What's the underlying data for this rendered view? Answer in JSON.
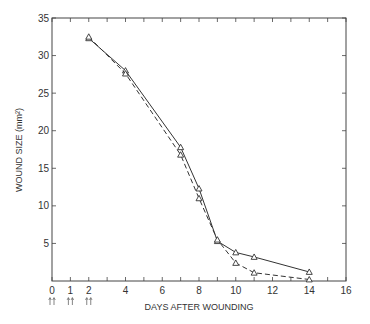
{
  "chart_data": {
    "type": "line",
    "title": "",
    "xlabel": "DAYS AFTER WOUNDING",
    "ylabel": "WOUND SIZE (mm²)",
    "xlim": [
      0,
      16
    ],
    "ylim": [
      0,
      35
    ],
    "x_ticks": [
      "0",
      "1",
      "2",
      "4",
      "6",
      "8",
      "10",
      "12",
      "14",
      "16"
    ],
    "y_ticks": [
      "5",
      "10",
      "15",
      "20",
      "25",
      "30",
      "35"
    ],
    "annotations": [
      "↑↑ at day 0",
      "↑↑ at day 1",
      "↑↑ at day 2"
    ],
    "grid": false,
    "legend": null,
    "series": [
      {
        "name": "solid line (triangles)",
        "style": "solid",
        "x": [
          2,
          4,
          7,
          8,
          9,
          10,
          11,
          14
        ],
        "values": [
          32.3,
          28.0,
          17.8,
          12.3,
          5.3,
          3.8,
          3.2,
          1.2
        ]
      },
      {
        "name": "dashed line (triangles)",
        "style": "dashed",
        "x": [
          2,
          4,
          7,
          8,
          9,
          10,
          11,
          14
        ],
        "values": [
          32.5,
          27.6,
          16.8,
          11.0,
          5.5,
          2.4,
          1.1,
          0.2
        ]
      }
    ]
  }
}
